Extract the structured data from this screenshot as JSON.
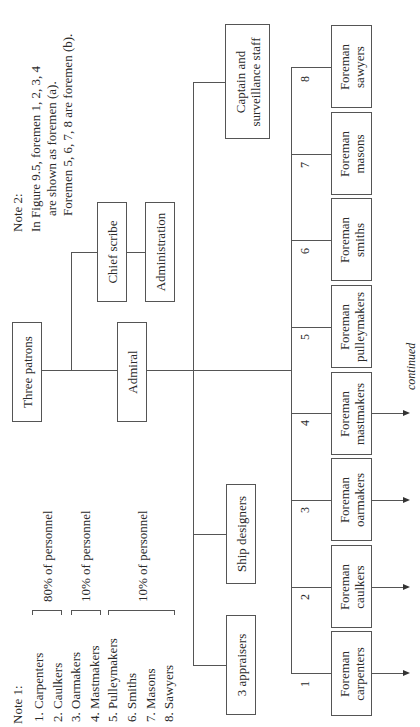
{
  "note2": {
    "title": "Note 2:",
    "lines": [
      "In Figure 9.5, foremen 1, 2, 3, 4",
      "are shown as foremen (a).",
      "Foremen 5, 6, 7, 8 are foremen (b)."
    ]
  },
  "note1": {
    "title": "Note 1:",
    "trades": [
      "1. Carpenters",
      "2. Caulkers",
      "3. Oarmakers",
      "4. Mastmakers",
      "5. Pulleymakers",
      "6. Smiths",
      "7. Masons",
      "8. Sawyers"
    ],
    "groups": [
      {
        "label": "80% of personnel"
      },
      {
        "label": "10% of personnel"
      },
      {
        "label": "10% of personnel"
      }
    ]
  },
  "nodes": {
    "three_patrons": "Three patrons",
    "chief_scribe": "Chief scribe",
    "administration": "Administration",
    "admiral": "Admiral",
    "captain": [
      "Captain and",
      "surveillance staff"
    ],
    "ship_designers": "Ship designers",
    "appraisers": "3 appraisers"
  },
  "foremen": [
    {
      "num": "1",
      "line1": "Foreman",
      "line2": "carpenters"
    },
    {
      "num": "2",
      "line1": "Foreman",
      "line2": "caulkers"
    },
    {
      "num": "3",
      "line1": "Foreman",
      "line2": "oarmakers"
    },
    {
      "num": "4",
      "line1": "Foreman",
      "line2": "mastmakers"
    },
    {
      "num": "5",
      "line1": "Foreman",
      "line2": "pulleymakers"
    },
    {
      "num": "6",
      "line1": "Foreman",
      "line2": "smiths"
    },
    {
      "num": "7",
      "line1": "Foreman",
      "line2": "masons"
    },
    {
      "num": "8",
      "line1": "Foreman",
      "line2": "sawyers"
    }
  ],
  "continued_label": "continued"
}
